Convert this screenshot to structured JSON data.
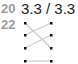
{
  "rows": [
    {
      "label": "20"
    },
    {
      "label": "22"
    }
  ],
  "ratio": "3.3 / 3.3",
  "diagram": {
    "left_dots": [
      23,
      35,
      48,
      61
    ],
    "right_dots": [
      23,
      35,
      48,
      61
    ],
    "connections": [
      [
        0,
        2
      ],
      [
        1,
        0
      ],
      [
        2,
        1
      ],
      [
        3,
        3
      ]
    ],
    "line_color": "#c8c8c8",
    "dot_color": "#111111"
  }
}
